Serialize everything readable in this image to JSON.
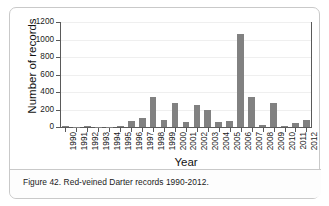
{
  "figure": {
    "caption": "Figure 42. Red-veined Darter records 1990-2012."
  },
  "chart_data": {
    "type": "bar",
    "title": "",
    "xlabel": "Year",
    "ylabel": "Number of records",
    "categories": [
      "1990",
      "1991",
      "1992",
      "1993",
      "1994",
      "1995",
      "1996",
      "1997",
      "1998",
      "1999",
      "2000",
      "2001",
      "2002",
      "2003",
      "2004",
      "2005",
      "2006",
      "2007",
      "2008",
      "2009",
      "2010",
      "2011",
      "2012"
    ],
    "values": [
      8,
      2,
      10,
      2,
      2,
      14,
      70,
      105,
      340,
      75,
      280,
      58,
      252,
      198,
      58,
      65,
      1060,
      340,
      22,
      270,
      10,
      45,
      80
    ],
    "ylim": [
      0,
      1200
    ],
    "yticks": [
      0,
      200,
      400,
      600,
      800,
      1000,
      1200
    ],
    "ytick_labels": [
      "0",
      "200",
      "400",
      "600",
      "800",
      "1000",
      "1200"
    ],
    "grid": true,
    "legend": false,
    "bar_color": "#818181",
    "axis_color": "#5a5a5a",
    "grid_color": "#efefef"
  }
}
